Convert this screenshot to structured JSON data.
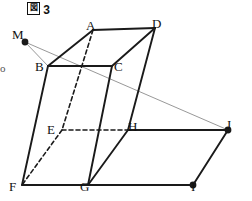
{
  "figure": {
    "caption_box_char": "図",
    "caption_number": "3",
    "caption_full": "図 3",
    "type": "geometry-solid-diagram"
  },
  "colors": {
    "stroke_solid": "#1a1a1a",
    "stroke_light": "#8c8c8c",
    "background": "#ffffff",
    "label_text": "#111111"
  },
  "vertices": [
    {
      "name": "A",
      "label": "A",
      "x": 93,
      "y": 30,
      "label_x": 86,
      "label_y": 19,
      "dot": false
    },
    {
      "name": "B",
      "label": "B",
      "x": 48,
      "y": 66,
      "label_x": 35,
      "label_y": 60,
      "dot": false
    },
    {
      "name": "C",
      "label": "C",
      "x": 112,
      "y": 66,
      "label_x": 114,
      "label_y": 60,
      "dot": false
    },
    {
      "name": "D",
      "label": "D",
      "x": 155,
      "y": 28,
      "label_x": 152,
      "label_y": 17,
      "dot": false
    },
    {
      "name": "E",
      "label": "E",
      "x": 62,
      "y": 130,
      "label_x": 47,
      "label_y": 123,
      "dot": false
    },
    {
      "name": "F",
      "label": "F",
      "x": 22,
      "y": 185,
      "label_x": 9,
      "label_y": 180,
      "dot": false
    },
    {
      "name": "G",
      "label": "G",
      "x": 88,
      "y": 185,
      "label_x": 80,
      "label_y": 180,
      "dot": false
    },
    {
      "name": "H",
      "label": "H",
      "x": 128,
      "y": 130,
      "label_x": 128,
      "label_y": 120,
      "dot": false
    },
    {
      "name": "I",
      "label": "I",
      "x": 193,
      "y": 185,
      "label_x": 191,
      "label_y": 180,
      "dot": true
    },
    {
      "name": "J",
      "label": "J",
      "x": 228,
      "y": 130,
      "label_x": 226,
      "label_y": 118,
      "dot": true
    },
    {
      "name": "M",
      "label": "M",
      "x": 25,
      "y": 42,
      "label_x": 12,
      "label_y": 28,
      "dot": true
    }
  ],
  "edges_solid": [
    {
      "name": "A-D",
      "from": "A",
      "to": "D"
    },
    {
      "name": "A-B",
      "from": "A",
      "to": "B"
    },
    {
      "name": "B-C",
      "from": "B",
      "to": "C"
    },
    {
      "name": "C-D",
      "from": "C",
      "to": "D"
    },
    {
      "name": "B-F",
      "from": "B",
      "to": "F"
    },
    {
      "name": "C-G",
      "from": "C",
      "to": "G"
    },
    {
      "name": "D-H",
      "from": "D",
      "to": "H"
    },
    {
      "name": "F-G",
      "from": "F",
      "to": "G"
    },
    {
      "name": "G-H",
      "from": "G",
      "to": "H"
    },
    {
      "name": "G-I",
      "from": "G",
      "to": "I"
    },
    {
      "name": "H-J",
      "from": "H",
      "to": "J"
    },
    {
      "name": "I-J",
      "from": "I",
      "to": "J"
    }
  ],
  "edges_dashed": [
    {
      "name": "A-E",
      "from": "A",
      "to": "E"
    },
    {
      "name": "E-F",
      "from": "E",
      "to": "F"
    },
    {
      "name": "E-H",
      "from": "E",
      "to": "H"
    }
  ],
  "edges_light": [
    {
      "name": "M-B",
      "from": "M",
      "to": "B"
    },
    {
      "name": "M-J",
      "from": "M",
      "to": "J"
    }
  ],
  "left_margin_mark": "o"
}
